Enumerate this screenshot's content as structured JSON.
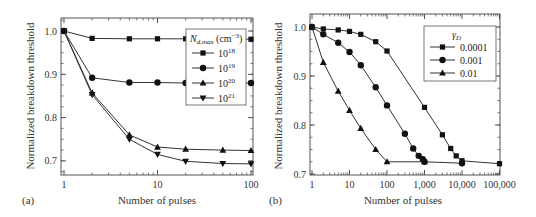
{
  "chart_data": [
    {
      "id": "a",
      "type": "line",
      "panel_label": "(a)",
      "xlabel": "Number of pulses",
      "ylabel": "Normalized breakdown threshold",
      "xscale": "log",
      "xlim": [
        0.85,
        105
      ],
      "ylim": [
        0.67,
        1.03
      ],
      "xticks": [
        1,
        10,
        100
      ],
      "xtick_labels": [
        "1",
        "10",
        "100"
      ],
      "yticks": [
        0.7,
        0.8,
        0.9,
        1.0
      ],
      "ytick_labels": [
        "0.7",
        "0.8",
        "0.9",
        "1.0"
      ],
      "legend": {
        "title": "N_d,max (cm^-3)",
        "title_main": "N",
        "title_sub": "d,max",
        "title_unit": " (cm",
        "title_sup": "−3",
        "title_close": ")",
        "position": "upper right"
      },
      "series": [
        {
          "name": "10^18",
          "base": "10",
          "exp": "18",
          "marker": "square",
          "x": [
            1,
            2,
            5,
            10,
            20,
            50,
            100
          ],
          "y": [
            1.0,
            0.983,
            0.982,
            0.982,
            0.982,
            0.981,
            0.981
          ]
        },
        {
          "name": "10^19",
          "base": "10",
          "exp": "19",
          "marker": "circle",
          "x": [
            1,
            2,
            5,
            10,
            20,
            50,
            100
          ],
          "y": [
            1.0,
            0.892,
            0.881,
            0.881,
            0.88,
            0.88,
            0.88
          ]
        },
        {
          "name": "10^20",
          "base": "10",
          "exp": "20",
          "marker": "triangle-up",
          "x": [
            1,
            2,
            5,
            10,
            20,
            50,
            100
          ],
          "y": [
            1.0,
            0.857,
            0.76,
            0.732,
            0.727,
            0.725,
            0.724
          ]
        },
        {
          "name": "10^21",
          "base": "10",
          "exp": "21",
          "marker": "triangle-down",
          "x": [
            1,
            2,
            5,
            10,
            20,
            50,
            100
          ],
          "y": [
            1.0,
            0.853,
            0.75,
            0.715,
            0.699,
            0.694,
            0.693
          ]
        }
      ]
    },
    {
      "id": "b",
      "type": "line",
      "panel_label": "(b)",
      "xlabel": "Number of pulses",
      "ylabel": "Normalized breakdown threshold",
      "xscale": "log",
      "xlim": [
        0.85,
        110000
      ],
      "ylim": [
        0.7,
        1.03
      ],
      "xticks": [
        1,
        10,
        100,
        1000,
        10000,
        100000
      ],
      "xtick_labels": [
        "1",
        "10",
        "100",
        "1,000",
        "10,000",
        "100,000"
      ],
      "yticks": [
        0.7,
        0.8,
        0.9,
        1.0
      ],
      "ytick_labels": [
        "0.7",
        "0.8",
        "0.9",
        "1.0"
      ],
      "legend": {
        "title": "γ_D",
        "title_main": "γ",
        "title_sub": "D",
        "position": "upper right"
      },
      "series": [
        {
          "name": "0.0001",
          "marker": "square",
          "x": [
            1,
            2,
            5,
            10,
            20,
            50,
            100,
            1000,
            3000,
            5000,
            7000,
            10000,
            100000
          ],
          "y": [
            1.0,
            0.996,
            0.994,
            0.991,
            0.985,
            0.97,
            0.951,
            0.836,
            0.78,
            0.752,
            0.737,
            0.727,
            0.721
          ]
        },
        {
          "name": "0.001",
          "marker": "circle",
          "x": [
            1,
            2,
            5,
            10,
            20,
            50,
            100,
            300,
            500,
            700,
            900,
            1000,
            10000
          ],
          "y": [
            1.0,
            0.985,
            0.968,
            0.949,
            0.922,
            0.877,
            0.84,
            0.782,
            0.752,
            0.737,
            0.73,
            0.725,
            0.722
          ]
        },
        {
          "name": "0.01",
          "marker": "triangle-up",
          "x": [
            1,
            2,
            5,
            10,
            20,
            50,
            100,
            1000
          ],
          "y": [
            1.0,
            0.928,
            0.869,
            0.83,
            0.793,
            0.75,
            0.725,
            0.725
          ]
        }
      ]
    }
  ]
}
